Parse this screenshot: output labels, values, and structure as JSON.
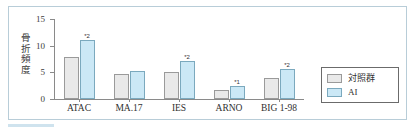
{
  "chart_data": {
    "type": "bar",
    "title": "",
    "xlabel": "",
    "ylabel": "骨折頻度",
    "ylim": [
      0,
      15
    ],
    "yticks": [
      0,
      5,
      10,
      15
    ],
    "grid": false,
    "legend_position": "right",
    "categories": [
      "ATAC",
      "MA.17",
      "IES",
      "ARNO",
      "BIG 1-98"
    ],
    "series": [
      {
        "name": "対照群",
        "color": "#e9e9e9",
        "values": [
          7.8,
          4.6,
          5.0,
          1.6,
          4.0
        ]
      },
      {
        "name": "AI",
        "color": "#cbe8f6",
        "values": [
          11.0,
          5.3,
          7.1,
          2.4,
          5.7
        ]
      }
    ],
    "annotations": [
      "*2",
      "",
      "*2",
      "*1",
      "*2"
    ]
  },
  "axis": {
    "y_tick_labels": [
      "15",
      "10",
      "5",
      "0"
    ],
    "y_axis_title": "骨折頻度"
  },
  "legend": {
    "items": [
      {
        "label": "対照群",
        "color": "#e9e9e9"
      },
      {
        "label": "AI",
        "color": "#cbe8f6"
      }
    ]
  },
  "colors": {
    "control": "#e9e9e9",
    "ai": "#cbe8f6",
    "border": "#b8cdd8",
    "accent": "#cfe3ee",
    "axis": "#8a8a8a"
  }
}
